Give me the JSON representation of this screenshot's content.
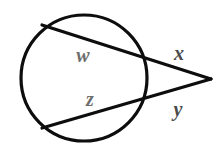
{
  "figure": {
    "background_color": "#ffffff",
    "width": 220,
    "height": 154,
    "stroke_color": "#0d0d0d",
    "stroke_width": 3.2,
    "circle": {
      "name": "circle",
      "cx": 84,
      "cy": 78,
      "r": 63,
      "stroke_color": "#0d0d0d",
      "stroke_width": 3.2,
      "fill": "none"
    },
    "secants": [
      {
        "name": "upper-secant",
        "x1": 42,
        "y1": 25,
        "x2": 211,
        "y2": 79,
        "stroke_color": "#0d0d0d",
        "stroke_width": 3.2,
        "near_circle_intersection_x": 143,
        "near_circle_intersection_y": 57
      },
      {
        "name": "lower-secant",
        "x1": 42,
        "y1": 128,
        "x2": 211,
        "y2": 79,
        "stroke_color": "#0d0d0d",
        "stroke_width": 3.2,
        "near_circle_intersection_x": 143,
        "near_circle_intersection_y": 98
      }
    ],
    "external_point": {
      "name": "external-vertex",
      "x": 211,
      "y": 79
    },
    "labels": [
      {
        "id": "w",
        "text": "w",
        "x": 83,
        "y": 57,
        "color": "#6e6e6e",
        "font_size": 21,
        "describes": "upper secant chord inside circle"
      },
      {
        "id": "x",
        "text": "x",
        "x": 179,
        "y": 55,
        "color": "#4a4a4a",
        "font_size": 21,
        "describes": "upper secant external segment"
      },
      {
        "id": "z",
        "text": "z",
        "x": 90,
        "y": 101,
        "color": "#6e6e6e",
        "font_size": 21,
        "describes": "lower secant chord inside circle"
      },
      {
        "id": "y",
        "text": "y",
        "x": 178,
        "y": 111,
        "color": "#4a4a4a",
        "font_size": 21,
        "describes": "lower secant external segment"
      }
    ]
  }
}
